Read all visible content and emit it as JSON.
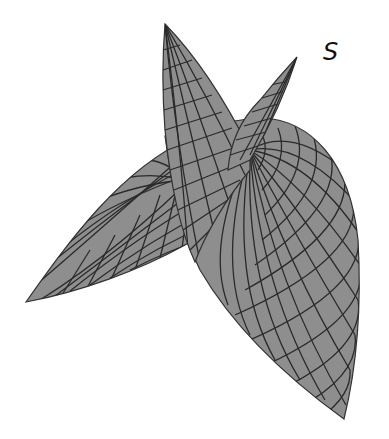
{
  "figure": {
    "label": "S",
    "colors": {
      "surface_fill": "#8e8e8e",
      "mesh_line": "#2a2a2a",
      "edge_line": "#333333",
      "background": "#ffffff"
    },
    "parts": [
      {
        "name": "left-leaf",
        "tip": [
          26,
          302
        ]
      },
      {
        "name": "tall-spike",
        "tip": [
          165,
          24
        ]
      },
      {
        "name": "right-spike",
        "tip": [
          297,
          57
        ]
      },
      {
        "name": "dome-lobe",
        "tip": [
          344,
          419
        ]
      }
    ]
  }
}
